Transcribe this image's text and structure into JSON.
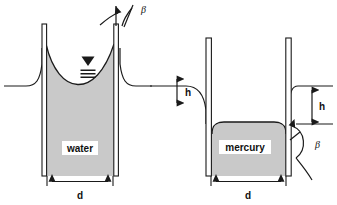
{
  "figure": {
    "background_color": "#ffffff",
    "line_color": "#1a1a1a",
    "fluid_fill_color": "#c9c9c9",
    "tube_fill_color": "#ffffff"
  },
  "labels": {
    "water": "water",
    "mercury": "mercury",
    "diameter_left": "d",
    "diameter_right": "d",
    "height_middle": "h",
    "height_right": "h",
    "beta_top": "β",
    "beta_bottom": "β"
  },
  "annotations": {
    "left_assembly": {
      "fluid": "water",
      "meniscus": "concave",
      "effect": "capillary rise",
      "contact_angle_symbol": "β",
      "diameter_symbol": "d",
      "free_surface_marker": "triangle-with-three-lines"
    },
    "right_assembly": {
      "fluid": "mercury",
      "meniscus": "convex",
      "effect": "capillary depression",
      "contact_angle_symbol": "β",
      "diameter_symbol": "d",
      "height_symbol": "h"
    }
  },
  "icons": {
    "free_surface": "free-surface-icon",
    "arrow_double": "double-arrow-icon",
    "arc_angle": "angle-arc-icon"
  }
}
